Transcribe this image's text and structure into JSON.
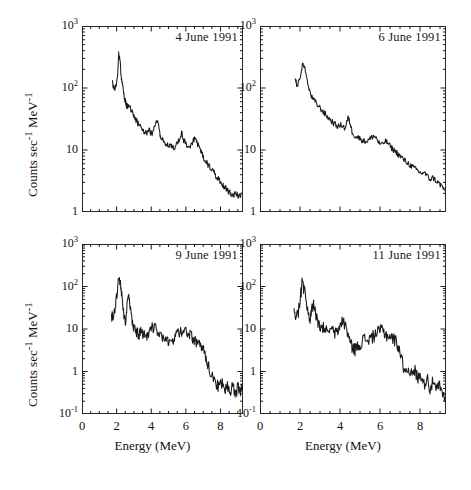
{
  "figure": {
    "background": "#ffffff",
    "ink": "#1a1a1a",
    "xlabel": "Energy (MeV)",
    "ylabel_html": "Counts sec<sup>-1</sup> MeV<sup>-1</sup>",
    "ylabel_plain": "Counts sec-1 MeV-1"
  },
  "chart_data": {
    "type": "line",
    "title": "",
    "xlabel": "Energy (MeV)",
    "ylabel": "Counts sec^-1 MeV^-1",
    "xlim": [
      0,
      9.3
    ],
    "xticks": [
      0,
      2,
      4,
      6,
      8
    ],
    "xtick_labels": [
      "0",
      "2",
      "4",
      "6",
      "8"
    ],
    "xminor_step": 0.5,
    "yscale": "log",
    "grid": false,
    "legend": "none",
    "panel_layout": "2x2",
    "panels": [
      {
        "id": "panel-4-june",
        "label": "4 June 1991",
        "row": 0,
        "col": 0,
        "ylim": [
          1,
          1000
        ],
        "yticks": [
          1,
          10,
          100,
          1000
        ],
        "ytick_labels": [
          "1",
          "10",
          "10^2",
          "10^3"
        ],
        "ytick_html": [
          "1",
          "10",
          "10<sup>2</sup>",
          "10<sup>3</sup>"
        ],
        "x": [
          1.75,
          1.85,
          1.95,
          2.05,
          2.12,
          2.18,
          2.25,
          2.32,
          2.4,
          2.5,
          2.6,
          2.7,
          2.8,
          2.9,
          3.0,
          3.1,
          3.2,
          3.3,
          3.45,
          3.6,
          3.75,
          3.9,
          4.05,
          4.2,
          4.35,
          4.45,
          4.55,
          4.7,
          4.85,
          5.0,
          5.15,
          5.3,
          5.45,
          5.6,
          5.75,
          5.9,
          6.05,
          6.2,
          6.35,
          6.5,
          6.65,
          6.8,
          6.95,
          7.1,
          7.25,
          7.4,
          7.55,
          7.7,
          7.85,
          8.0,
          8.15,
          8.3,
          8.45,
          8.6,
          8.75,
          8.9,
          9.05,
          9.2
        ],
        "y": [
          120,
          95,
          108,
          150,
          360,
          300,
          175,
          120,
          85,
          62,
          50,
          55,
          48,
          40,
          35,
          32,
          28,
          25,
          22,
          20,
          19,
          21,
          17,
          24,
          30,
          22,
          16,
          14,
          13,
          12,
          11,
          11,
          12,
          15,
          19,
          14,
          12,
          11,
          13,
          15,
          13,
          10,
          8.5,
          7,
          6,
          5.2,
          4.6,
          4.0,
          3.5,
          3.1,
          2.7,
          2.4,
          2.2,
          2.0,
          1.9,
          2.1,
          1.8,
          2.0
        ],
        "noise": 0.12
      },
      {
        "id": "panel-6-june",
        "label": "6 June 1991",
        "row": 0,
        "col": 1,
        "ylim": [
          1,
          1000
        ],
        "yticks": [
          1,
          10,
          100,
          1000
        ],
        "ytick_labels": [
          "1",
          "10",
          "10^2",
          "10^3"
        ],
        "ytick_html": [
          "1",
          "10",
          "10<sup>2</sup>",
          "10<sup>3</sup>"
        ],
        "x": [
          1.75,
          1.85,
          1.95,
          2.05,
          2.15,
          2.25,
          2.35,
          2.45,
          2.6,
          2.75,
          2.9,
          3.05,
          3.2,
          3.35,
          3.5,
          3.65,
          3.8,
          3.95,
          4.1,
          4.25,
          4.4,
          4.5,
          4.6,
          4.75,
          4.9,
          5.05,
          5.2,
          5.35,
          5.5,
          5.65,
          5.8,
          5.95,
          6.1,
          6.25,
          6.4,
          6.55,
          6.7,
          6.85,
          7.0,
          7.15,
          7.3,
          7.45,
          7.6,
          7.75,
          7.9,
          8.05,
          8.2,
          8.35,
          8.5,
          8.65,
          8.8,
          8.95,
          9.1,
          9.25
        ],
        "y": [
          150,
          105,
          125,
          175,
          260,
          200,
          130,
          95,
          70,
          60,
          52,
          46,
          40,
          35,
          31,
          28,
          25,
          24,
          26,
          22,
          33,
          28,
          20,
          17,
          16,
          15,
          14,
          14,
          15,
          17,
          16,
          13,
          12,
          14,
          13,
          11,
          10,
          9,
          8,
          7.2,
          6.5,
          6,
          5.4,
          5,
          4.6,
          4.2,
          4.4,
          3.8,
          3.4,
          3.6,
          3.2,
          2.9,
          2.6,
          2.2
        ],
        "noise": 0.11
      },
      {
        "id": "panel-9-june",
        "label": "9 June 1991",
        "row": 1,
        "col": 0,
        "ylim": [
          0.1,
          1000
        ],
        "yticks": [
          0.1,
          1,
          10,
          100,
          1000
        ],
        "ytick_labels": [
          "10^-1",
          "1",
          "10",
          "10^2",
          "10^3"
        ],
        "ytick_html": [
          "10<sup>-1</sup>",
          "1",
          "10",
          "10<sup>2</sup>",
          "10<sup>3</sup>"
        ],
        "x": [
          1.7,
          1.8,
          1.9,
          2.0,
          2.1,
          2.2,
          2.3,
          2.4,
          2.5,
          2.6,
          2.7,
          2.8,
          2.9,
          3.0,
          3.15,
          3.3,
          3.45,
          3.6,
          3.75,
          3.9,
          4.05,
          4.2,
          4.35,
          4.5,
          4.65,
          4.8,
          4.95,
          5.1,
          5.25,
          5.4,
          5.55,
          5.7,
          5.85,
          6.0,
          6.15,
          6.3,
          6.45,
          6.6,
          6.75,
          6.9,
          7.05,
          7.2,
          7.35,
          7.5,
          7.65,
          7.8,
          7.95,
          8.1,
          8.25,
          8.4,
          8.55,
          8.7,
          8.85,
          9.0,
          9.15,
          9.25
        ],
        "y": [
          22,
          20,
          28,
          60,
          150,
          130,
          60,
          25,
          14,
          35,
          55,
          28,
          14,
          10,
          9,
          8,
          9,
          8,
          7,
          9,
          11,
          12,
          10,
          7,
          6,
          5.5,
          5,
          5.5,
          6,
          7,
          8,
          9,
          10,
          9,
          8,
          7,
          6,
          5,
          4.5,
          4,
          3,
          2,
          1.2,
          0.9,
          0.7,
          0.5,
          0.45,
          0.6,
          0.35,
          0.5,
          0.3,
          0.55,
          0.25,
          0.45,
          0.3,
          0.5
        ],
        "noise": 0.3
      },
      {
        "id": "panel-11-june",
        "label": "11 June 1991",
        "row": 1,
        "col": 1,
        "ylim": [
          0.1,
          1000
        ],
        "yticks": [
          0.1,
          1,
          10,
          100,
          1000
        ],
        "ytick_labels": [
          "10^-1",
          "1",
          "10",
          "10^2",
          "10^3"
        ],
        "ytick_html": [
          "10<sup>-1</sup>",
          "1",
          "10",
          "10<sup>2</sup>",
          "10<sup>3</sup>"
        ],
        "x": [
          1.7,
          1.8,
          1.9,
          2.0,
          2.1,
          2.2,
          2.3,
          2.4,
          2.5,
          2.6,
          2.7,
          2.8,
          2.9,
          3.05,
          3.2,
          3.35,
          3.5,
          3.65,
          3.8,
          3.95,
          4.1,
          4.25,
          4.4,
          4.5,
          4.6,
          4.75,
          4.9,
          5.05,
          5.2,
          5.35,
          5.5,
          5.65,
          5.8,
          5.95,
          6.1,
          6.25,
          6.4,
          6.55,
          6.7,
          6.85,
          7.0,
          7.15,
          7.3,
          7.45,
          7.6,
          7.75,
          7.9,
          8.05,
          8.2,
          8.35,
          8.5,
          8.65,
          8.8,
          8.95,
          9.1,
          9.25
        ],
        "y": [
          25,
          20,
          24,
          50,
          120,
          100,
          45,
          22,
          16,
          30,
          40,
          22,
          13,
          10,
          11,
          9,
          10,
          9,
          8,
          10,
          17,
          13,
          8,
          5,
          4,
          3.5,
          4,
          5,
          6,
          5.5,
          6,
          7,
          8,
          9,
          10,
          8,
          7,
          6.5,
          6,
          5,
          3,
          1.5,
          1.0,
          1.3,
          0.8,
          1.1,
          0.7,
          0.9,
          0.5,
          0.8,
          0.4,
          0.6,
          0.35,
          0.5,
          0.3,
          0.25
        ],
        "noise": 0.34
      }
    ]
  }
}
